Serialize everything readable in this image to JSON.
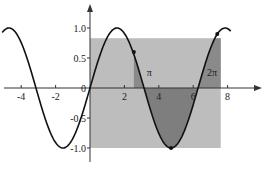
{
  "chart_data": {
    "type": "line",
    "title": "",
    "xlabel": "",
    "ylabel": "",
    "function": "y = sin(x)",
    "xlim": [
      -5.2,
      9.8
    ],
    "ylim": [
      -1.2,
      1.35
    ],
    "grid": false,
    "x_ticks": [
      {
        "value": -4,
        "label": "-4"
      },
      {
        "value": -2,
        "label": "-2"
      },
      {
        "value": 2,
        "label": "2"
      },
      {
        "value": 4,
        "label": "4"
      },
      {
        "value": 6,
        "label": "6"
      },
      {
        "value": 8,
        "label": "8"
      }
    ],
    "y_ticks": [
      {
        "value": 1.0,
        "label": "1.0"
      },
      {
        "value": 0.5,
        "label": "0.5"
      },
      {
        "value": 0,
        "label": "0"
      },
      {
        "value": -0.5,
        "label": "-0.5"
      },
      {
        "value": -1.0,
        "label": "-1.0"
      }
    ],
    "series": [
      {
        "name": "sin(x)",
        "x_range": [
          -5.1,
          8.2
        ]
      }
    ],
    "shaded_regions": [
      {
        "name": "light rectangle",
        "x": [
          0,
          7.6
        ],
        "y": [
          -1.0,
          0.83
        ],
        "color": "#bdbdbd"
      },
      {
        "name": "triangle near pi",
        "vertices": [
          [
            2.55,
            0.6
          ],
          [
            2.55,
            0
          ],
          [
            3.14,
            0
          ]
        ],
        "color": "#8a8a8a"
      },
      {
        "name": "area under curve pi to 2pi",
        "x": [
          3.14,
          6.28
        ],
        "color": "#7e7e7e"
      },
      {
        "name": "strip after 2pi",
        "x": [
          6.28,
          7.6
        ],
        "color": "#8a8a8a"
      }
    ],
    "points": [
      {
        "x": 2.55,
        "y": 0.6
      },
      {
        "x": 4.71,
        "y": -1.0
      },
      {
        "x": 7.4,
        "y": 0.9
      }
    ],
    "annotations": [
      {
        "text": "π",
        "x": 3.3,
        "y": 0.2
      },
      {
        "text": "2π",
        "x": 6.8,
        "y": 0.2
      }
    ]
  }
}
